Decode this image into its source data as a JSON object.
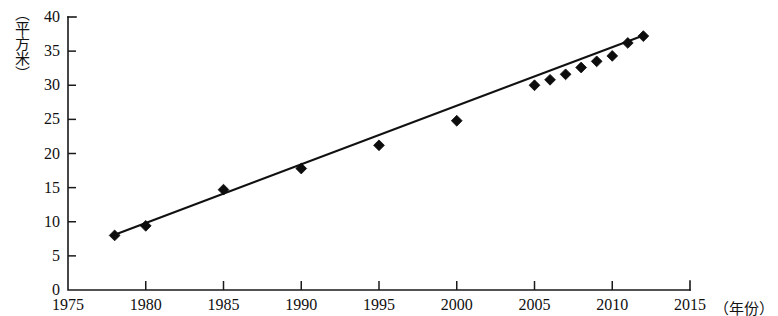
{
  "chart_data": {
    "type": "scatter",
    "title": "",
    "subtitle": "",
    "xlabel": "（年份）",
    "ylabel": "（平方米）",
    "xlim": [
      1975,
      2015
    ],
    "ylim": [
      0,
      40
    ],
    "x_ticks": [
      1975,
      1980,
      1985,
      1990,
      1995,
      2000,
      2005,
      2010,
      2015
    ],
    "x_tick_labels": [
      "1975",
      "1980",
      "1985",
      "1990",
      "1995",
      "2000",
      "2005",
      "2010",
      "2015"
    ],
    "y_ticks": [
      0,
      5,
      10,
      15,
      20,
      25,
      30,
      35,
      40
    ],
    "y_tick_labels": [
      "0",
      "5",
      "10",
      "15",
      "20",
      "25",
      "30",
      "35",
      "40"
    ],
    "grid": false,
    "legend": false,
    "legend_position": "none",
    "marker": "diamond",
    "marker_color": "#0d0d0d",
    "line_color": "#111111",
    "background_color": "#ffffff",
    "series": [
      {
        "name": "人均住房面积",
        "type": "scatter",
        "x": [
          1978,
          1980,
          1985,
          1990,
          1995,
          2000,
          2005,
          2006,
          2007,
          2008,
          2009,
          2010,
          2011,
          2012
        ],
        "values": [
          8.0,
          9.4,
          14.7,
          17.8,
          21.2,
          24.8,
          30.0,
          30.8,
          31.6,
          32.6,
          33.5,
          34.3,
          36.2,
          37.2
        ]
      },
      {
        "name": "趋势线",
        "type": "line",
        "x": [
          1978,
          2012
        ],
        "values": [
          8.1,
          37.3
        ]
      }
    ]
  },
  "axes": {
    "x_axis_name": "x-axis",
    "y_axis_name": "y-axis"
  }
}
